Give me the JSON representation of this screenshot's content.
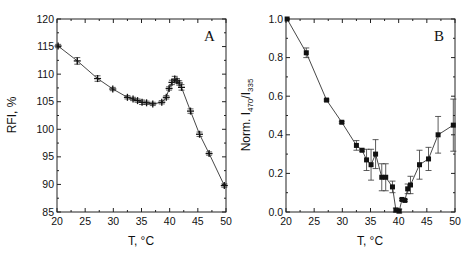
{
  "chart_data": [
    {
      "type": "line",
      "panel_label": "A",
      "title": "",
      "xlabel": "T, °C",
      "ylabel": "RFI, %",
      "xlim": [
        20,
        50
      ],
      "ylim": [
        85,
        120
      ],
      "xticks": [
        20,
        25,
        30,
        35,
        40,
        45,
        50
      ],
      "yticks": [
        85,
        90,
        95,
        100,
        105,
        110,
        115,
        120
      ],
      "grid": false,
      "legend": null,
      "marker": "cross",
      "series": [
        {
          "name": "RFI",
          "x": [
            20.2,
            23.6,
            27.2,
            29.9,
            32.5,
            33.5,
            34.3,
            35.1,
            35.9,
            37.0,
            38.6,
            39.4,
            39.9,
            40.4,
            40.9,
            41.3,
            41.7,
            42.1,
            43.7,
            45.3,
            47.0,
            49.7
          ],
          "y": [
            115.1,
            112.4,
            109.2,
            107.3,
            105.8,
            105.5,
            105.2,
            104.9,
            104.8,
            104.6,
            104.9,
            105.8,
            107.4,
            108.5,
            109.1,
            108.8,
            108.4,
            107.6,
            103.3,
            99.1,
            95.6,
            89.8
          ],
          "yerr": [
            0.3,
            0.6,
            0.5,
            0.3,
            0.3,
            0.3,
            0.3,
            0.4,
            0.3,
            0.3,
            0.3,
            0.3,
            0.3,
            0.4,
            0.5,
            0.4,
            0.4,
            0.5,
            0.4,
            0.4,
            0.3,
            0.3
          ]
        }
      ]
    },
    {
      "type": "line",
      "panel_label": "B",
      "title": "",
      "xlabel": "T, °C",
      "ylabel": "Norm. I470/I335",
      "ylabel_main": "Norm. I",
      "ylabel_sub1": "470",
      "ylabel_mid": "/I",
      "ylabel_sub2": "335",
      "xlim": [
        20,
        50
      ],
      "ylim": [
        0.0,
        1.0
      ],
      "xticks": [
        20,
        25,
        30,
        35,
        40,
        45,
        50
      ],
      "yticks": [
        0.0,
        0.2,
        0.4,
        0.6,
        0.8,
        1.0
      ],
      "grid": false,
      "legend": null,
      "marker": "square",
      "series": [
        {
          "name": "Norm. I470/I335",
          "x": [
            20.2,
            23.6,
            27.2,
            29.9,
            32.5,
            33.5,
            34.3,
            35.1,
            35.9,
            37.0,
            37.7,
            38.9,
            39.5,
            40.1,
            40.6,
            41.1,
            41.6,
            42.1,
            43.7,
            45.3,
            47.0,
            49.7
          ],
          "y": [
            1.0,
            0.825,
            0.58,
            0.465,
            0.345,
            0.32,
            0.27,
            0.245,
            0.3,
            0.18,
            0.18,
            0.13,
            0.01,
            0.005,
            0.065,
            0.06,
            0.12,
            0.14,
            0.245,
            0.275,
            0.4,
            0.45
          ],
          "yerr": [
            0.0,
            0.025,
            0.005,
            0.005,
            0.025,
            0.005,
            0.055,
            0.08,
            0.075,
            0.07,
            0.07,
            0.03,
            0.01,
            0.01,
            0.005,
            0.005,
            0.025,
            0.045,
            0.075,
            0.06,
            0.095,
            0.135
          ]
        }
      ]
    }
  ]
}
